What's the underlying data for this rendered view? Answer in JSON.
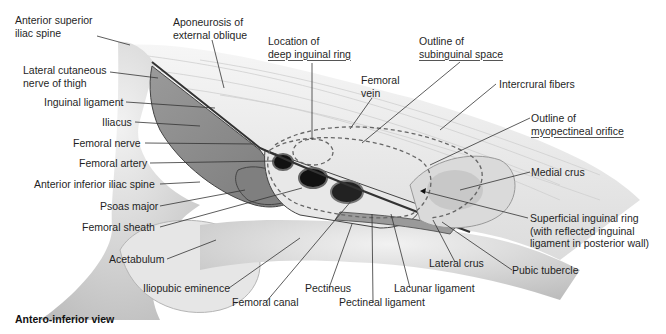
{
  "figure": {
    "caption": "Antero-inferior view",
    "colors": {
      "background": "#ffffff",
      "muscle": "#8c8c8c",
      "bone": "#d9d9d9",
      "aponeurosis": "#ececec",
      "vessel_lumen": "#1a1a1a",
      "leader_line": "#333333"
    },
    "labels": {
      "ant_sup_iliac_spine": [
        "Anterior superior",
        "iliac spine"
      ],
      "lat_cut_nerve": [
        "Lateral cutaneous",
        "nerve of thigh"
      ],
      "inguinal_ligament": "Inguinal ligament",
      "iliacus": "Iliacus",
      "femoral_nerve": "Femoral nerve",
      "femoral_artery": "Femoral artery",
      "ant_inf_iliac_spine": "Anterior inferior iliac spine",
      "psoas_major": "Psoas major",
      "femoral_sheath": "Femoral sheath",
      "acetabulum": "Acetabulum",
      "iliopubic_eminence": "Iliopubic eminence",
      "femoral_canal": "Femoral canal",
      "pectineus": "Pectineus",
      "pectineal_ligament": "Pectineal ligament",
      "lacunar_ligament": "Lacunar ligament",
      "lateral_crus": "Lateral crus",
      "pubic_tubercle": "Pubic tubercle",
      "superficial_ring": [
        "Superficial inguinal ring",
        "(with reflected inguinal",
        "ligament in posterior wall)"
      ],
      "medial_crus": "Medial crus",
      "myopectineal": [
        "Outline of",
        "myopectineal orifice"
      ],
      "intercrural_fibers": "Intercrural fibers",
      "subinguinal": [
        "Outline of",
        "subinguinal space"
      ],
      "femoral_vein": [
        "Femoral",
        "vein"
      ],
      "deep_ring": [
        "Location of",
        "deep inguinal ring"
      ],
      "aponeurosis": [
        "Aponeurosis of",
        "external oblique"
      ]
    }
  }
}
